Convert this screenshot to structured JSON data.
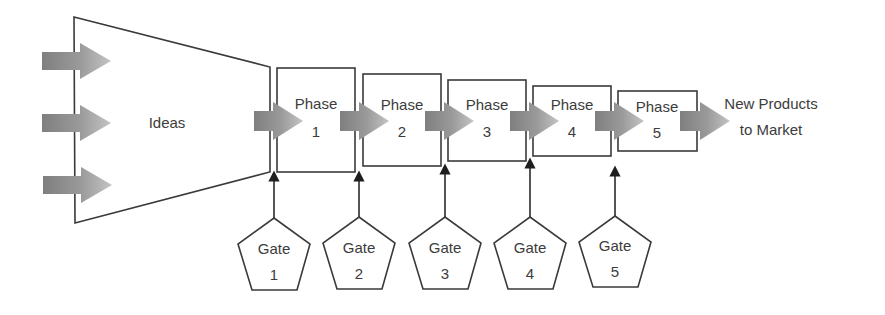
{
  "diagram": {
    "funnel": {
      "label": "Ideas"
    },
    "input_arrows": 3,
    "phases": [
      {
        "line1": "Phase",
        "line2": "1"
      },
      {
        "line1": "Phase",
        "line2": "2"
      },
      {
        "line1": "Phase",
        "line2": "3"
      },
      {
        "line1": "Phase",
        "line2": "4"
      },
      {
        "line1": "Phase",
        "line2": "5"
      }
    ],
    "gates": [
      {
        "line1": "Gate",
        "line2": "1"
      },
      {
        "line1": "Gate",
        "line2": "2"
      },
      {
        "line1": "Gate",
        "line2": "3"
      },
      {
        "line1": "Gate",
        "line2": "4"
      },
      {
        "line1": "Gate",
        "line2": "5"
      }
    ],
    "output": {
      "line1": "New Products",
      "line2": "to Market"
    },
    "colors": {
      "arrow_dark": "#7f7f7f",
      "arrow_light": "#bdbdbd",
      "stroke": "#3a3a3a",
      "text": "#3c3c3c"
    }
  }
}
